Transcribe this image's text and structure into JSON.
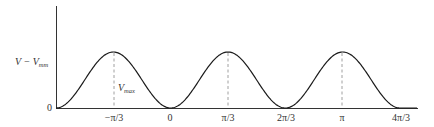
{
  "figure": {
    "y_axis_label": {
      "main": "V − V",
      "subscript": "mm"
    },
    "peak_label": {
      "main": "V",
      "subscript": "max"
    },
    "origin_label": "0",
    "x_tick_labels": [
      "−π/3",
      "0",
      "π/3",
      "2π/3",
      "π",
      "4π/3"
    ],
    "colors": {
      "curve": "#1a1a1a",
      "axis": "#333333",
      "dashed": "#888888",
      "text": "#333333"
    }
  },
  "chart_data": {
    "type": "line",
    "title": "",
    "xlabel": "",
    "ylabel": "V − V_mm",
    "x_ticks": [
      "−π/3",
      "0",
      "π/3",
      "2π/3",
      "π",
      "4π/3"
    ],
    "x_tick_values_rad": [
      -1.0472,
      0,
      1.0472,
      2.0944,
      3.1416,
      4.1888
    ],
    "series": [
      {
        "name": "V − V_min (periodic potential, period 2π/3)",
        "x": [
          -2.0944,
          -1.0472,
          0,
          1.0472,
          2.0944,
          3.1416,
          4.1888
        ],
        "values": [
          0,
          1,
          0,
          1,
          0,
          1,
          0
        ],
        "note": "Cosine-shaped curve: minima (0) at −2π/3, 0, 2π/3, 4π/3; maxima (V_max) at −π/3, π/3, π"
      }
    ],
    "annotations": [
      {
        "text": "V_max",
        "x": -1.0472,
        "description": "dashed vertical line from peak to baseline"
      },
      {
        "text": "dashed line",
        "x": 1.0472
      },
      {
        "text": "dashed line",
        "x": 3.1416
      }
    ],
    "ylim": [
      0,
      1.6
    ],
    "y_ticks": [
      "0"
    ],
    "grid": false,
    "legend": null
  }
}
